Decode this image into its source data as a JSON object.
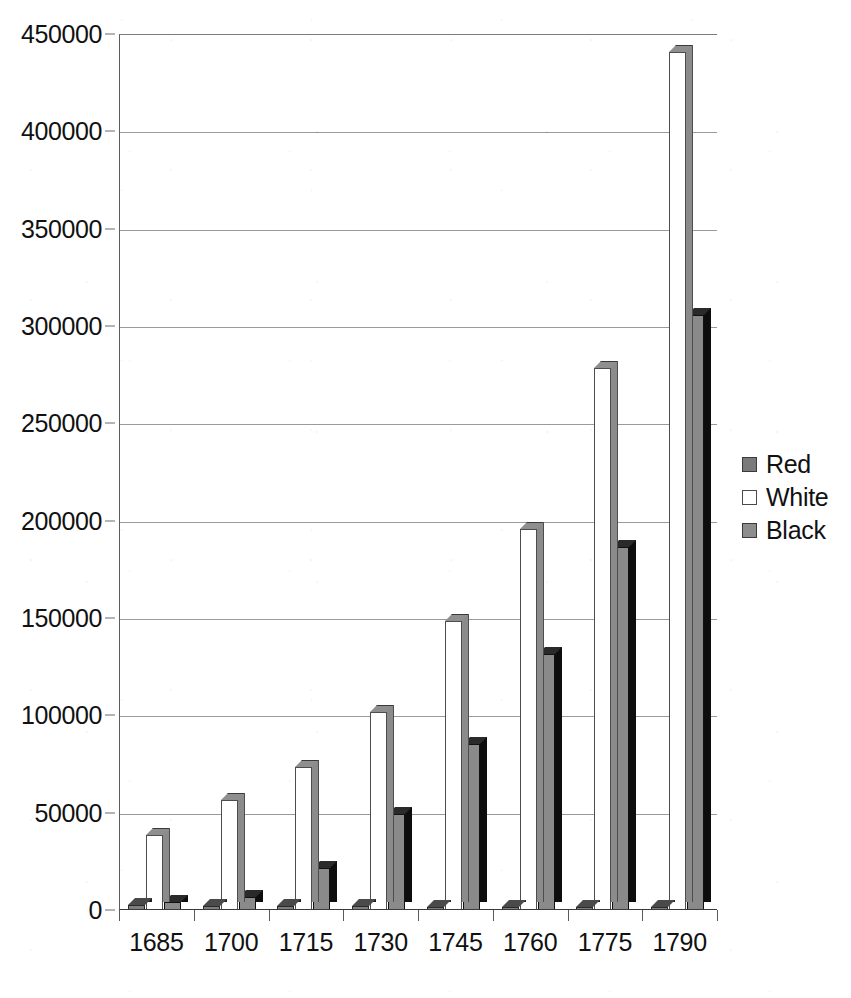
{
  "chart_data": {
    "type": "bar",
    "title": "",
    "subtitle": "",
    "xlabel": "",
    "ylabel": "",
    "categories": [
      "1685",
      "1700",
      "1715",
      "1730",
      "1745",
      "1760",
      "1775",
      "1790"
    ],
    "series": [
      {
        "name": "Red",
        "values": [
          2000,
          1800,
          1500,
          1500,
          1200,
          1200,
          1000,
          1000
        ]
      },
      {
        "name": "White",
        "values": [
          38000,
          56000,
          73000,
          101000,
          148000,
          195000,
          278000,
          440000
        ]
      },
      {
        "name": "Black",
        "values": [
          3500,
          6000,
          21000,
          49000,
          85000,
          131000,
          186000,
          305000
        ]
      }
    ],
    "ylim": [
      0,
      450000
    ],
    "y_ticks": [
      0,
      50000,
      100000,
      150000,
      200000,
      250000,
      300000,
      350000,
      400000,
      450000
    ],
    "y_tick_labels": [
      "0",
      "50000",
      "100000",
      "150000",
      "200000",
      "250000",
      "300000",
      "350000",
      "400000",
      "450000"
    ],
    "x_tick_labels": [
      "1685",
      "1700",
      "1715",
      "1730",
      "1745",
      "1760",
      "1775",
      "1790"
    ],
    "grid": true,
    "legend_position": "right",
    "legend_entries": [
      "Red",
      "White",
      "Black"
    ],
    "style": "3d-column",
    "colors": {
      "red_series": "#7e7e7e",
      "white_series": "#ffffff",
      "black_series": "#8a8a8a",
      "gridline": "#9a9a9a",
      "axis": "#3a3a3a",
      "text": "#111111",
      "background": "#ffffff"
    }
  }
}
